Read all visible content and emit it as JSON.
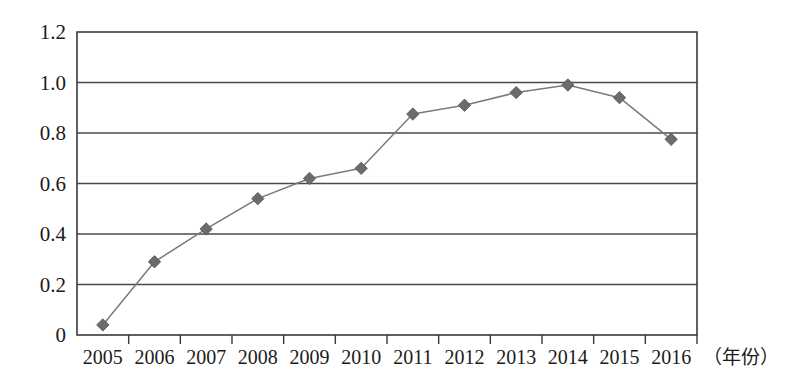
{
  "chart_data": {
    "type": "line",
    "title": "",
    "subtitle": "",
    "xlabel": "（年份）",
    "ylabel": "",
    "categories": [
      "2005",
      "2006",
      "2007",
      "2008",
      "2009",
      "2010",
      "2011",
      "2012",
      "2013",
      "2014",
      "2015",
      "2016"
    ],
    "values": [
      0.04,
      0.29,
      0.42,
      0.54,
      0.62,
      0.66,
      0.875,
      0.91,
      0.96,
      0.99,
      0.94,
      0.775
    ],
    "series": [
      {
        "name": "",
        "values": [
          0.04,
          0.29,
          0.42,
          0.54,
          0.62,
          0.66,
          0.875,
          0.91,
          0.96,
          0.99,
          0.94,
          0.775
        ],
        "marker": "diamond",
        "color": "#6b6b6b"
      }
    ],
    "ylim": [
      0,
      1.2
    ],
    "yticks": [
      0,
      0.2,
      0.4,
      0.6,
      0.8,
      1.0,
      1.2
    ],
    "ytick_labels": [
      "0",
      "0.2",
      "0.4",
      "0.6",
      "0.8",
      "1.0",
      "1.2"
    ],
    "xtick_labels": [
      "2005",
      "2006",
      "2007",
      "2008",
      "2009",
      "2010",
      "2011",
      "2012",
      "2013",
      "2014",
      "2015",
      "2016"
    ],
    "grid": true,
    "grid_axis": "y",
    "legend": false,
    "legend_position": "none",
    "annotations": []
  },
  "axis": {
    "x_title": "（年份）",
    "y_tick_0": "0",
    "y_tick_1": "0.2",
    "y_tick_2": "0.4",
    "y_tick_3": "0.6",
    "y_tick_4": "0.8",
    "y_tick_5": "1.0",
    "y_tick_6": "1.2"
  },
  "style": {
    "line_color": "#7a7a7a",
    "marker_color": "#6e6e6e",
    "axis_color": "#3a3a3a",
    "grid_color": "#4a4a4a",
    "background": "#ffffff",
    "text_color": "#1b1b1b"
  }
}
